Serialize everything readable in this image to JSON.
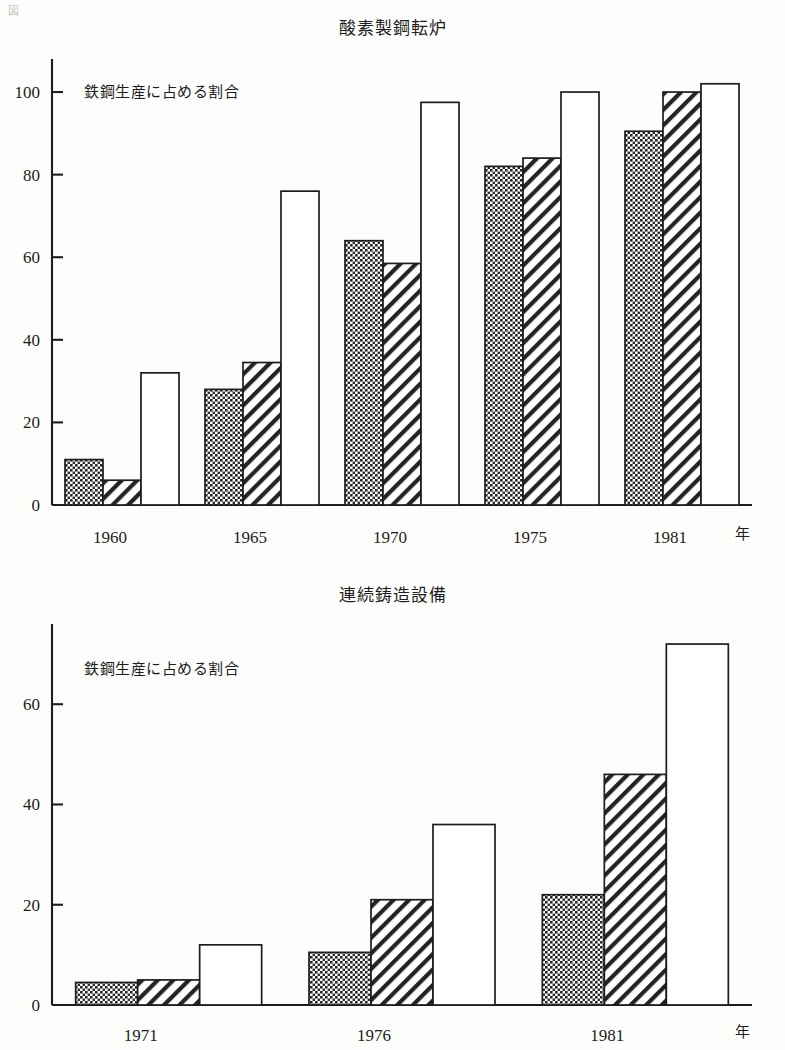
{
  "page": {
    "corner_mark": "図"
  },
  "chart_data": [
    {
      "id": "oxygen-converter",
      "type": "bar",
      "title": "酸素製鋼転炉",
      "inner_label": "鉄鋼生産に占める割合",
      "xlabel": "",
      "ylabel": "",
      "x_unit": "年",
      "categories": [
        "1960",
        "1965",
        "1970",
        "1975",
        "1981"
      ],
      "ylim": [
        0,
        108
      ],
      "yticks": [
        0,
        20,
        40,
        60,
        80,
        100
      ],
      "ytick_labels": [
        "0",
        "20",
        "40",
        "60",
        "80",
        "100"
      ],
      "grid": false,
      "legend": "none",
      "series": [
        {
          "name": "checkered",
          "pattern": "checker",
          "values": [
            11,
            28,
            64,
            82,
            90.5
          ]
        },
        {
          "name": "hatched",
          "pattern": "diagonal",
          "values": [
            6,
            34.5,
            58.5,
            84,
            100
          ]
        },
        {
          "name": "open",
          "pattern": "white",
          "values": [
            32,
            76,
            97.5,
            100,
            102
          ]
        }
      ]
    },
    {
      "id": "continuous-casting",
      "type": "bar",
      "title": "連続鋳造設備",
      "inner_label": "鉄鋼生産に占める割合",
      "xlabel": "",
      "ylabel": "",
      "x_unit": "年",
      "categories": [
        "1971",
        "1976",
        "1981"
      ],
      "ylim": [
        0,
        76
      ],
      "yticks": [
        0,
        20,
        40,
        60
      ],
      "ytick_labels": [
        "0",
        "20",
        "40",
        "60"
      ],
      "grid": false,
      "legend": "none",
      "series": [
        {
          "name": "checkered",
          "pattern": "checker",
          "values": [
            4.5,
            10.5,
            22
          ]
        },
        {
          "name": "hatched",
          "pattern": "diagonal",
          "values": [
            5,
            21,
            46
          ]
        },
        {
          "name": "open",
          "pattern": "white",
          "values": [
            12,
            36,
            72
          ]
        }
      ]
    }
  ]
}
